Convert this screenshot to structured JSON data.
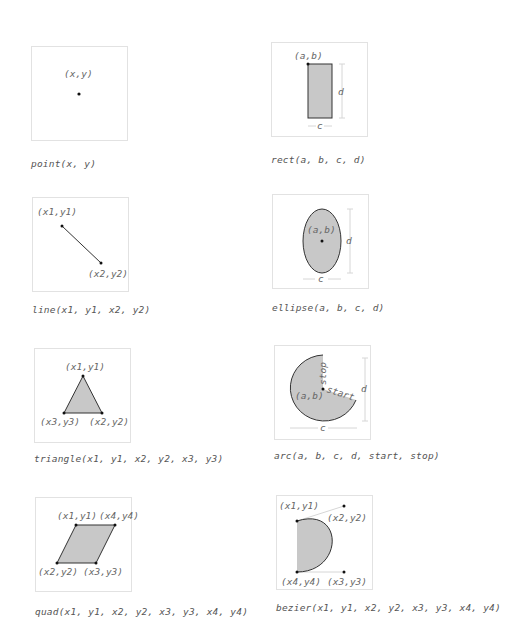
{
  "colors": {
    "panel_border": "#e2e2e2",
    "shape_fill": "#c8c8c8",
    "shape_stroke": "#333333",
    "dimension_line": "#d6d6d6",
    "text": "#666666"
  },
  "diagrams": [
    {
      "id": "point",
      "caption": "point(x, y)",
      "labels": {
        "p": "(x,y)"
      }
    },
    {
      "id": "rect",
      "caption": "rect(a, b, c, d)",
      "labels": {
        "corner": "(a,b)",
        "width": "c",
        "height": "d"
      }
    },
    {
      "id": "line",
      "caption": "line(x1, y1, x2, y2)",
      "labels": {
        "p1": "(x1,y1)",
        "p2": "(x2,y2)"
      }
    },
    {
      "id": "ellipse",
      "caption": "ellipse(a, b, c, d)",
      "labels": {
        "center": "(a,b)",
        "width": "c",
        "height": "d"
      }
    },
    {
      "id": "triangle",
      "caption": "triangle(x1, y1, x2, y2, x3, y3)",
      "labels": {
        "p1": "(x1,y1)",
        "p2": "(x2,y2)",
        "p3": "(x3,y3)"
      }
    },
    {
      "id": "arc",
      "caption": "arc(a, b, c, d, start, stop)",
      "labels": {
        "center": "(a,b)",
        "width": "c",
        "height": "d",
        "start": "start",
        "stop": "stop"
      }
    },
    {
      "id": "quad",
      "caption": "quad(x1, y1, x2, y2, x3, y3, x4, y4)",
      "labels": {
        "p1": "(x1,y1)",
        "p2": "(x2,y2)",
        "p3": "(x3,y3)",
        "p4": "(x4,y4)"
      }
    },
    {
      "id": "bezier",
      "caption": "bezier(x1, y1, x2, y2, x3, y3, x4, y4)",
      "labels": {
        "p1": "(x1,y1)",
        "p2": "(x2,y2)",
        "p3": "(x3,y3)",
        "p4": "(x4,y4)"
      }
    }
  ]
}
